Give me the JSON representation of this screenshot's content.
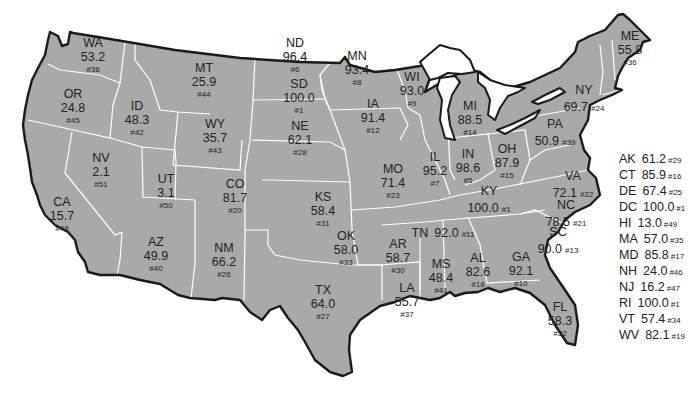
{
  "map": {
    "fill_color": "#a9a9a9",
    "border_color": "#ffffff",
    "outline_color": "#1a1a1a",
    "states": [
      {
        "abbr": "WA",
        "value": "53.2",
        "rank": "#38",
        "x": 93,
        "y": 37,
        "layout": "stack"
      },
      {
        "abbr": "OR",
        "value": "24.8",
        "rank": "#45",
        "x": 73,
        "y": 88,
        "layout": "stack"
      },
      {
        "abbr": "CA",
        "value": "15.7",
        "rank": "#48",
        "x": 62,
        "y": 196,
        "layout": "stack"
      },
      {
        "abbr": "NV",
        "value": "2.1",
        "rank": "#51",
        "x": 101,
        "y": 152,
        "layout": "stack"
      },
      {
        "abbr": "ID",
        "value": "48.3",
        "rank": "#42",
        "x": 137,
        "y": 100,
        "layout": "stack"
      },
      {
        "abbr": "MT",
        "value": "25.9",
        "rank": "#44",
        "x": 204,
        "y": 62,
        "layout": "stack"
      },
      {
        "abbr": "WY",
        "value": "35.7",
        "rank": "#43",
        "x": 215,
        "y": 118,
        "layout": "stack"
      },
      {
        "abbr": "UT",
        "value": "3.1",
        "rank": "#50",
        "x": 166,
        "y": 173,
        "layout": "stack"
      },
      {
        "abbr": "CO",
        "value": "81.7",
        "rank": "#20",
        "x": 235,
        "y": 178,
        "layout": "stack"
      },
      {
        "abbr": "AZ",
        "value": "49.9",
        "rank": "#40",
        "x": 156,
        "y": 236,
        "layout": "stack"
      },
      {
        "abbr": "NM",
        "value": "66.2",
        "rank": "#26",
        "x": 224,
        "y": 242,
        "layout": "stack"
      },
      {
        "abbr": "ND",
        "value": "96.4",
        "rank": "#6",
        "x": 295,
        "y": 37,
        "layout": "stack"
      },
      {
        "abbr": "SD",
        "value": "100.0",
        "rank": "#1",
        "x": 299,
        "y": 78,
        "layout": "stack"
      },
      {
        "abbr": "NE",
        "value": "62.1",
        "rank": "#28",
        "x": 300,
        "y": 120,
        "layout": "stack"
      },
      {
        "abbr": "KS",
        "value": "58.4",
        "rank": "#31",
        "x": 323,
        "y": 191,
        "layout": "stack"
      },
      {
        "abbr": "OK",
        "value": "58.0",
        "rank": "#33",
        "x": 346,
        "y": 230,
        "layout": "stack"
      },
      {
        "abbr": "TX",
        "value": "64.0",
        "rank": "#27",
        "x": 323,
        "y": 284,
        "layout": "stack"
      },
      {
        "abbr": "MN",
        "value": "93.4",
        "rank": "#8",
        "x": 357,
        "y": 50,
        "layout": "stack"
      },
      {
        "abbr": "IA",
        "value": "91.4",
        "rank": "#12",
        "x": 373,
        "y": 98,
        "layout": "stack"
      },
      {
        "abbr": "MO",
        "value": "71.4",
        "rank": "#23",
        "x": 393,
        "y": 163,
        "layout": "stack"
      },
      {
        "abbr": "AR",
        "value": "58.7",
        "rank": "#30",
        "x": 398,
        "y": 238,
        "layout": "stack"
      },
      {
        "abbr": "LA",
        "value": "55.7",
        "rank": "#37",
        "x": 407,
        "y": 282,
        "layout": "stack"
      },
      {
        "abbr": "WI",
        "value": "93.0",
        "rank": "#9",
        "x": 412,
        "y": 71,
        "layout": "stack"
      },
      {
        "abbr": "IL",
        "value": "95.2",
        "rank": "#7",
        "x": 435,
        "y": 151,
        "layout": "stack"
      },
      {
        "abbr": "MI",
        "value": "88.5",
        "rank": "#14",
        "x": 470,
        "y": 100,
        "layout": "stack"
      },
      {
        "abbr": "IN",
        "value": "98.6",
        "rank": "#5",
        "x": 468,
        "y": 148,
        "layout": "stack"
      },
      {
        "abbr": "OH",
        "value": "87.9",
        "rank": "#15",
        "x": 507,
        "y": 143,
        "layout": "stack"
      },
      {
        "abbr": "KY",
        "value": "100.0",
        "rank": "#1",
        "x": 489,
        "y": 185,
        "layout": "kyspecial"
      },
      {
        "abbr": "TN",
        "value": "92.0",
        "rank": "#11",
        "x": 443,
        "y": 224,
        "layout": "inline"
      },
      {
        "abbr": "MS",
        "value": "48.4",
        "rank": "#41",
        "x": 441,
        "y": 258,
        "layout": "stack"
      },
      {
        "abbr": "AL",
        "value": "82.6",
        "rank": "#18",
        "x": 478,
        "y": 252,
        "layout": "stack"
      },
      {
        "abbr": "GA",
        "value": "92.1",
        "rank": "#10",
        "x": 521,
        "y": 251,
        "layout": "stack"
      },
      {
        "abbr": "FL",
        "value": "58.3",
        "rank": "#32",
        "x": 560,
        "y": 301,
        "layout": "stack"
      },
      {
        "abbr": "SC",
        "value": "90.0",
        "rank": "#13",
        "x": 558,
        "y": 226,
        "layout": "stackinlinerank"
      },
      {
        "abbr": "NC",
        "value": "78.5",
        "rank": "#21",
        "x": 566,
        "y": 199,
        "layout": "stackinlinerank"
      },
      {
        "abbr": "VA",
        "value": "72.1",
        "rank": "#22",
        "x": 573,
        "y": 170,
        "layout": "stackinlinerank"
      },
      {
        "abbr": "PA",
        "value": "50.9",
        "rank": "#39",
        "x": 555,
        "y": 118,
        "layout": "stackinlinerank"
      },
      {
        "abbr": "NY",
        "value": "69.7",
        "rank": "#24",
        "x": 584,
        "y": 84,
        "layout": "stackinlinerank"
      },
      {
        "abbr": "ME",
        "value": "55.8",
        "rank": "#36",
        "x": 630,
        "y": 30,
        "layout": "stack"
      }
    ]
  },
  "legend": {
    "items": [
      {
        "abbr": "AK",
        "value": "61.2",
        "rank": "#29"
      },
      {
        "abbr": "CT",
        "value": "85.9",
        "rank": "#16"
      },
      {
        "abbr": "DE",
        "value": "67.4",
        "rank": "#25"
      },
      {
        "abbr": "DC",
        "value": "100.0",
        "rank": "#1"
      },
      {
        "abbr": "HI",
        "value": "13.0",
        "rank": "#49"
      },
      {
        "abbr": "MA",
        "value": "57.0",
        "rank": "#35"
      },
      {
        "abbr": "MD",
        "value": "85.8",
        "rank": "#17"
      },
      {
        "abbr": "NH",
        "value": "24.0",
        "rank": "#46"
      },
      {
        "abbr": "NJ",
        "value": "16.2",
        "rank": "#47"
      },
      {
        "abbr": "RI",
        "value": "100.0",
        "rank": "#1"
      },
      {
        "abbr": "VT",
        "value": "57.4",
        "rank": "#34"
      },
      {
        "abbr": "WV",
        "value": "82.1",
        "rank": "#19"
      }
    ]
  }
}
